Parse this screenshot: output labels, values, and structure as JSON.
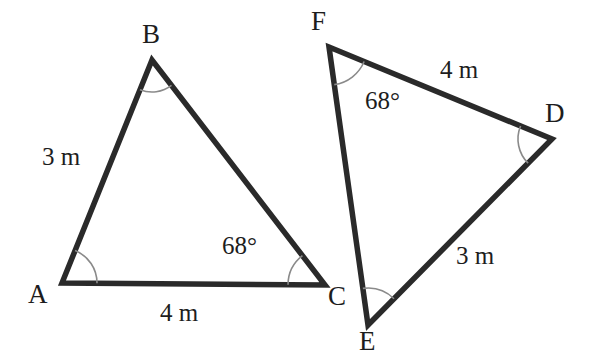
{
  "figure": {
    "type": "geometry-diagram",
    "background_color": "#ffffff",
    "stroke_color": "#2a2a2a",
    "arc_color": "#8a8a8a",
    "text_color": "#1d1d1d",
    "stroke_width": 5.5,
    "arc_width": 1.6
  },
  "triangles": [
    {
      "name": "triangle-abc",
      "vertices": [
        {
          "name": "A",
          "label": "A",
          "x": 62,
          "y": 283,
          "label_x": 28,
          "label_y": 281
        },
        {
          "name": "B",
          "label": "B",
          "x": 152,
          "y": 60,
          "label_x": 142,
          "label_y": 21
        },
        {
          "name": "C",
          "label": "C",
          "x": 325,
          "y": 285,
          "label_x": 328,
          "label_y": 283
        }
      ],
      "sides": [
        {
          "name": "side-ab",
          "from": "A",
          "to": "B",
          "label": "3 m",
          "label_x": 42,
          "label_y": 144
        },
        {
          "name": "side-ac",
          "from": "A",
          "to": "C",
          "label": "4 m",
          "label_x": 160,
          "label_y": 300
        },
        {
          "name": "side-bc",
          "from": "B",
          "to": "C",
          "label": "",
          "label_x": 0,
          "label_y": 0
        }
      ],
      "angles": [
        {
          "name": "angle-a",
          "at": "A",
          "label": "",
          "radius": 35,
          "label_x": 0,
          "label_y": 0
        },
        {
          "name": "angle-b",
          "at": "B",
          "label": "",
          "radius": 32,
          "label_x": 0,
          "label_y": 0
        },
        {
          "name": "angle-c",
          "at": "C",
          "label": "68°",
          "radius": 37,
          "label_x": 222,
          "label_y": 233
        }
      ]
    },
    {
      "name": "triangle-def",
      "vertices": [
        {
          "name": "F",
          "label": "F",
          "x": 329,
          "y": 47,
          "label_x": 311,
          "label_y": 8
        },
        {
          "name": "D",
          "label": "D",
          "x": 552,
          "y": 139,
          "label_x": 545,
          "label_y": 100
        },
        {
          "name": "E",
          "label": "E",
          "x": 368,
          "y": 325,
          "label_x": 359,
          "label_y": 328
        }
      ],
      "sides": [
        {
          "name": "side-fd",
          "from": "F",
          "to": "D",
          "label": "4 m",
          "label_x": 440,
          "label_y": 57
        },
        {
          "name": "side-ed",
          "from": "E",
          "to": "D",
          "label": "3 m",
          "label_x": 456,
          "label_y": 243
        },
        {
          "name": "side-fe",
          "from": "F",
          "to": "E",
          "label": "",
          "label_x": 0,
          "label_y": 0
        }
      ],
      "angles": [
        {
          "name": "angle-f",
          "at": "F",
          "label": "68°",
          "radius": 38,
          "label_x": 365,
          "label_y": 88
        },
        {
          "name": "angle-d",
          "at": "D",
          "label": "",
          "radius": 34,
          "label_x": 0,
          "label_y": 0
        },
        {
          "name": "angle-e",
          "at": "E",
          "label": "",
          "radius": 37,
          "label_x": 0,
          "label_y": 0
        }
      ]
    }
  ]
}
